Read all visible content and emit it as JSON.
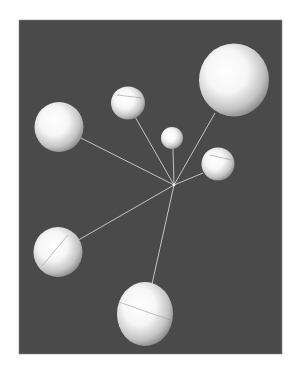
{
  "figure": {
    "background_color": "#4a4a4a",
    "border_color": "#8a8a8a",
    "line_color": "#d8d8d8",
    "sphere_color": "#ffffff",
    "sphere_shade_color": "#8c8c8c"
  },
  "hub": {
    "id": "hub"
  },
  "spheres": [
    {
      "id": "sphere-large-top-right",
      "size": "large"
    },
    {
      "id": "sphere-small-top",
      "size": "small"
    },
    {
      "id": "sphere-left",
      "size": "medium"
    },
    {
      "id": "sphere-center-small",
      "size": "tiny"
    },
    {
      "id": "sphere-right-middle",
      "size": "small"
    },
    {
      "id": "sphere-lower-left",
      "size": "medium"
    },
    {
      "id": "sphere-bottom",
      "size": "large"
    }
  ]
}
